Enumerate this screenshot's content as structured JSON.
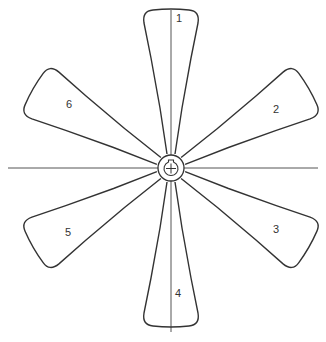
{
  "diagram": {
    "type": "fan-blade-layout",
    "center": {
      "x": 171,
      "y": 168
    },
    "stroke_color": "#333333",
    "axis_color": "#555555",
    "background": "#ffffff",
    "axes": {
      "horizontal": {
        "x1": 8,
        "x2": 318,
        "y": 168
      },
      "vertical": {
        "x": 171,
        "y1": 10,
        "y2": 332
      }
    },
    "hub": {
      "outer_radius": 13,
      "inner_radius": 8,
      "marker": "crosshair"
    },
    "blades": [
      {
        "number": "1",
        "angle_deg": 0,
        "label": "1",
        "label_pos": {
          "x": 179,
          "y": 22
        }
      },
      {
        "number": "2",
        "angle_deg": 60,
        "label": "2",
        "label_pos": {
          "x": 276,
          "y": 113
        }
      },
      {
        "number": "3",
        "angle_deg": 120,
        "label": "3",
        "label_pos": {
          "x": 276,
          "y": 233
        }
      },
      {
        "number": "4",
        "angle_deg": 180,
        "label": "4",
        "label_pos": {
          "x": 178,
          "y": 297
        }
      },
      {
        "number": "5",
        "angle_deg": 240,
        "label": "5",
        "label_pos": {
          "x": 68,
          "y": 236
        }
      },
      {
        "number": "6",
        "angle_deg": 300,
        "label": "6",
        "label_pos": {
          "x": 69,
          "y": 108
        }
      }
    ]
  }
}
